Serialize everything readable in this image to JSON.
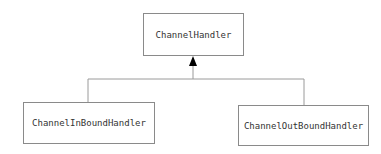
{
  "diagram": {
    "type": "class-hierarchy",
    "colors": {
      "line": "#9a9a9a",
      "border": "#8a8a8a",
      "text": "#333333",
      "arrow": "#000000"
    },
    "nodes": [
      {
        "id": "parent",
        "label": "ChannelHandler"
      },
      {
        "id": "child_in",
        "label": "ChannelInBoundHandler"
      },
      {
        "id": "child_out",
        "label": "ChannelOutBoundHandler"
      }
    ],
    "edges": [
      {
        "from": "child_in",
        "to": "parent",
        "arrow": "filled-triangle"
      },
      {
        "from": "child_out",
        "to": "parent",
        "arrow": "filled-triangle"
      }
    ]
  }
}
